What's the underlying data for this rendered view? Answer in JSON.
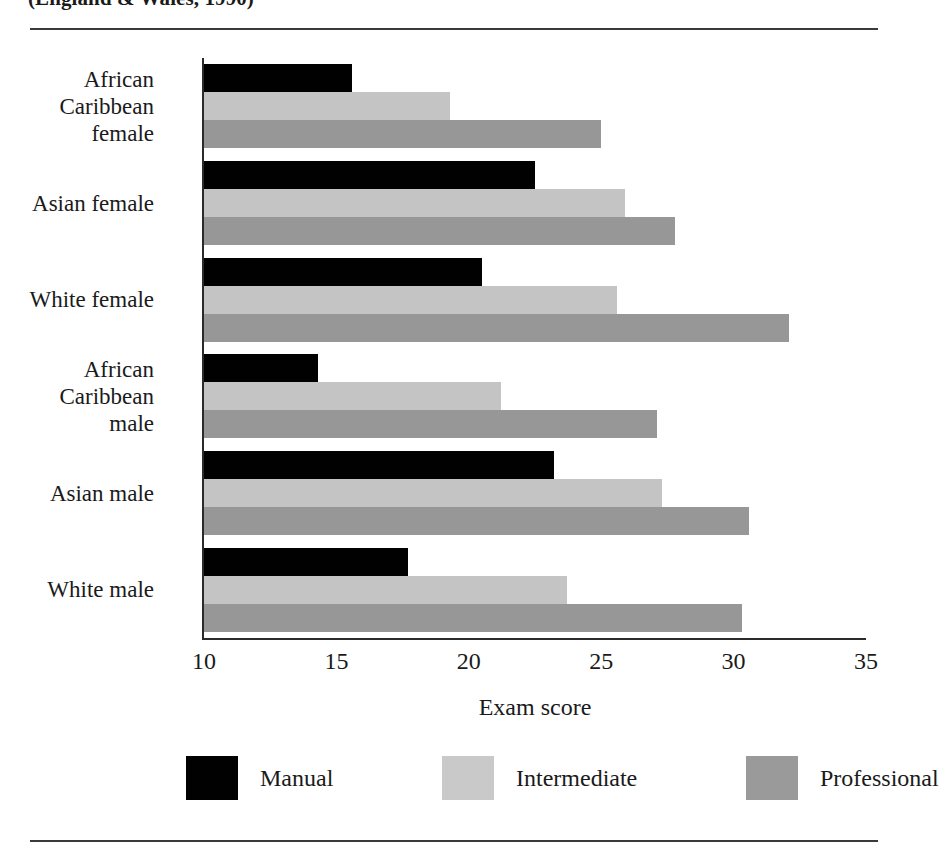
{
  "figure": {
    "title": "(England & Wales, 1990)",
    "rule_color": "#3a3a3a"
  },
  "chart_data": {
    "type": "bar",
    "orientation": "horizontal",
    "title": "(England & Wales, 1990)",
    "xlabel": "Exam score",
    "ylabel": "",
    "xlim": [
      10,
      35
    ],
    "xticks": [
      10,
      15,
      20,
      25,
      30,
      35
    ],
    "xtick_labels": [
      "10",
      "15",
      "20",
      "25",
      "30",
      "35"
    ],
    "grid": false,
    "legend_position": "bottom",
    "categories": [
      "African Caribbean female",
      "Asian female",
      "White female",
      "African Caribbean male",
      "Asian male",
      "White male"
    ],
    "category_label_lines": [
      [
        "African",
        "Caribbean",
        "female"
      ],
      [
        "Asian female"
      ],
      [
        "White female"
      ],
      [
        "African",
        "Caribbean",
        "male"
      ],
      [
        "Asian male"
      ],
      [
        "White male"
      ]
    ],
    "series": [
      {
        "name": "Manual",
        "color": "#010101",
        "values": [
          15.6,
          22.5,
          20.5,
          14.3,
          23.2,
          17.7
        ]
      },
      {
        "name": "Intermediate",
        "color": "#c4c4c4",
        "values": [
          19.3,
          25.9,
          25.6,
          21.2,
          27.3,
          23.7
        ]
      },
      {
        "name": "Professional",
        "color": "#979797",
        "values": [
          25.0,
          27.8,
          32.1,
          27.1,
          30.6,
          30.3
        ]
      }
    ]
  }
}
